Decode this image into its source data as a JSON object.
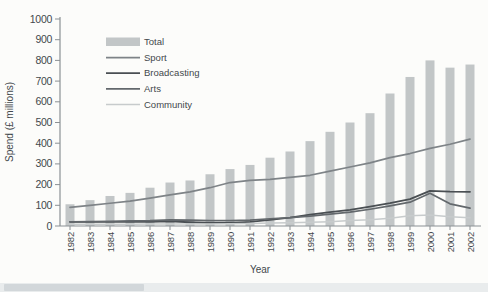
{
  "chart_data": {
    "type": "bar+line",
    "xlabel": "Year",
    "ylabel": "Spend (£ millions)",
    "ylim": [
      0,
      1000
    ],
    "yticks": [
      0,
      100,
      200,
      300,
      400,
      500,
      600,
      700,
      800,
      900,
      1000
    ],
    "categories": [
      1982,
      1983,
      1984,
      1985,
      1986,
      1987,
      1988,
      1989,
      1990,
      1991,
      1992,
      1993,
      1994,
      1995,
      1996,
      1997,
      1998,
      1999,
      2000,
      2001,
      2002
    ],
    "bar_series": {
      "name": "Total",
      "color": "#c2c6c7",
      "values": [
        105,
        125,
        145,
        160,
        185,
        210,
        220,
        250,
        275,
        295,
        330,
        360,
        410,
        455,
        500,
        545,
        640,
        720,
        800,
        765,
        780
      ]
    },
    "line_series": [
      {
        "name": "Sport",
        "color": "#7e8387",
        "width": 1.7,
        "values": [
          90,
          100,
          110,
          120,
          135,
          150,
          165,
          185,
          210,
          220,
          225,
          235,
          245,
          265,
          285,
          305,
          330,
          350,
          375,
          395,
          420
        ]
      },
      {
        "name": "Broadcasting",
        "color": "#4a4f53",
        "width": 1.8,
        "values": [
          20,
          20,
          20,
          20,
          20,
          22,
          18,
          15,
          15,
          20,
          30,
          40,
          55,
          67,
          78,
          94,
          110,
          130,
          170,
          166,
          165
        ]
      },
      {
        "name": "Arts",
        "color": "#63686c",
        "width": 1.7,
        "values": [
          20,
          21,
          23,
          25,
          26,
          30,
          28,
          26,
          26,
          28,
          35,
          40,
          48,
          57,
          67,
          81,
          97,
          115,
          158,
          107,
          86
        ]
      },
      {
        "name": "Community",
        "color": "#c7cbcc",
        "width": 1.5,
        "values": [
          8,
          8,
          8,
          9,
          10,
          10,
          10,
          10,
          11,
          12,
          14,
          16,
          18,
          21,
          26,
          30,
          37,
          49,
          53,
          45,
          40
        ]
      }
    ],
    "legend": [
      "Total",
      "Sport",
      "Broadcasting",
      "Arts",
      "Community"
    ],
    "legend_position": "inside-top-left",
    "grid": false
  },
  "style": {
    "axis_color": "#8a9094",
    "tick_label_color": "#43484c",
    "page_background": "#fcfcfa"
  }
}
